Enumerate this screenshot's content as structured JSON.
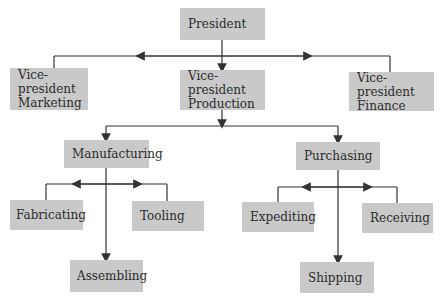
{
  "diagram": {
    "type": "org-chart",
    "nodes": {
      "president": "President",
      "vp_marketing_line1": "Vice-president",
      "vp_marketing_line2": "Marketing",
      "vp_production_line1": "Vice-president",
      "vp_production_line2": "Production",
      "vp_finance_line1": "Vice-president",
      "vp_finance_line2": "Finance",
      "manufacturing": "Manufacturing",
      "purchasing": "Purchasing",
      "fabricating": "Fabricating",
      "tooling": "Tooling",
      "assembling": "Assembling",
      "expediting": "Expediting",
      "receiving": "Receiving",
      "shipping": "Shipping"
    },
    "edges": [
      [
        "President",
        "Vice-president Marketing"
      ],
      [
        "President",
        "Vice-president Production"
      ],
      [
        "President",
        "Vice-president Finance"
      ],
      [
        "Vice-president Production",
        "Manufacturing"
      ],
      [
        "Vice-president Production",
        "Purchasing"
      ],
      [
        "Manufacturing",
        "Fabricating"
      ],
      [
        "Manufacturing",
        "Tooling"
      ],
      [
        "Manufacturing",
        "Assembling"
      ],
      [
        "Purchasing",
        "Expediting"
      ],
      [
        "Purchasing",
        "Receiving"
      ],
      [
        "Purchasing",
        "Shipping"
      ]
    ],
    "colors": {
      "box": "#c9c9c9",
      "line": "#333333",
      "text": "#2b2b2b"
    }
  }
}
